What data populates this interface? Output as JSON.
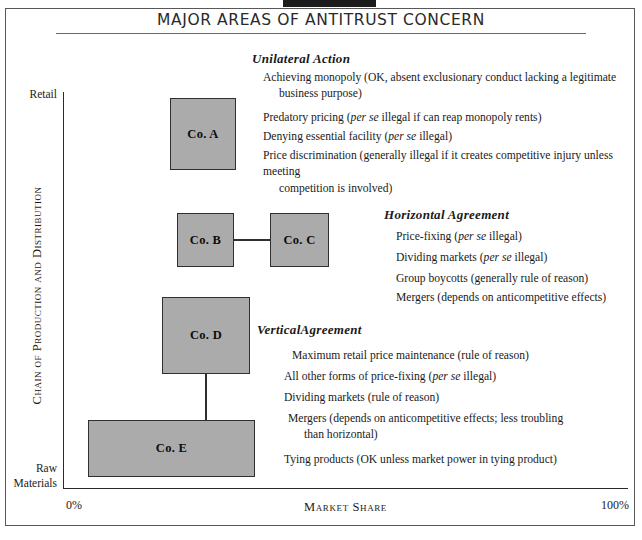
{
  "figure": {
    "title": "MAJOR AREAS OF ANTITRUST CONCERN",
    "colors": {
      "box_fill": "#ababab",
      "box_stroke": "#2f2f2f",
      "axis": "#2b2b2b",
      "frame": "#585858"
    }
  },
  "axes": {
    "y_top_label": "Retail",
    "y_bottom_label_line1": "Raw",
    "y_bottom_label_line2": "Materials",
    "y_title": "Chain of Production and Distribution",
    "x_min_label": "0%",
    "x_max_label": "100%",
    "x_title": "Market Share"
  },
  "boxes": [
    {
      "id": "a",
      "label": "Co. A"
    },
    {
      "id": "b",
      "label": "Co. B"
    },
    {
      "id": "c",
      "label": "Co. C"
    },
    {
      "id": "d",
      "label": "Co. D"
    },
    {
      "id": "e",
      "label": "Co. E"
    }
  ],
  "sections": {
    "unilateral": {
      "heading": "Unilateral Action",
      "items": [
        {
          "l1": "Achieving monopoly (OK, absent exclusionary conduct lacking a legitimate",
          "l2": "business purpose)"
        },
        {
          "pre": "Predatory pricing (",
          "em": "per se",
          "post": " illegal if can reap monopoly rents)"
        },
        {
          "pre": "Denying essential facility (",
          "em": "per se",
          "post": " illegal)"
        },
        {
          "l1": "Price discrimination (generally illegal if it creates competitive injury unless meeting",
          "l2": "competition is involved)"
        }
      ]
    },
    "horizontal": {
      "heading": "Horizontal  Agreement",
      "items": [
        {
          "pre": "Price-fixing (",
          "em": "per se",
          "post": " illegal)"
        },
        {
          "pre": "Dividing markets (",
          "em": "per se",
          "post": " illegal)"
        },
        {
          "pre": "Group boycotts (generally rule of reason)",
          "em": "",
          "post": ""
        },
        {
          "pre": "Mergers (depends on anticompetitive effects)",
          "em": "",
          "post": ""
        }
      ]
    },
    "vertical": {
      "heading": "VerticalAgreement",
      "items": [
        {
          "pre": "Maximum retail price maintenance (rule of reason)",
          "em": "",
          "post": ""
        },
        {
          "pre": "All other forms of price-fixing (",
          "em": "per se",
          "post": " illegal)"
        },
        {
          "pre": "Dividing markets (rule of reason)",
          "em": "",
          "post": ""
        },
        {
          "l1": "Mergers (depends on anticompetitive effects; less troubling",
          "l2": "than horizontal)"
        },
        {
          "pre": "Tying products (OK unless market power in tying product)",
          "em": "",
          "post": ""
        }
      ]
    }
  }
}
